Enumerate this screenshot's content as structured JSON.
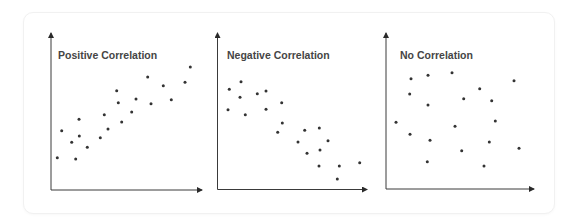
{
  "colors": {
    "axis": "#3a3a3a",
    "dot": "#333333",
    "title": "#454545",
    "card_border": "#f1f1f1"
  },
  "chart_data": [
    {
      "type": "scatter",
      "title": "Positive Correlation",
      "xlabel": "",
      "ylabel": "",
      "grid": false,
      "axes": {
        "origin": [
          51,
          190
        ],
        "x_end": 202,
        "y_top": 33
      },
      "points": [
        [
          57.3,
          157.7
        ],
        [
          61.7,
          130.7
        ],
        [
          71.7,
          142.3
        ],
        [
          75.7,
          159.0
        ],
        [
          79.0,
          119.3
        ],
        [
          79.3,
          136.0
        ],
        [
          87.3,
          147.3
        ],
        [
          100.3,
          137.7
        ],
        [
          104.3,
          114.7
        ],
        [
          108.0,
          129.0
        ],
        [
          116.7,
          90.7
        ],
        [
          118.3,
          102.7
        ],
        [
          121.7,
          122.0
        ],
        [
          131.7,
          112.0
        ],
        [
          136.0,
          99.0
        ],
        [
          147.7,
          77.0
        ],
        [
          151.0,
          103.7
        ],
        [
          163.3,
          85.7
        ],
        [
          171.3,
          99.7
        ],
        [
          185.0,
          82.3
        ],
        [
          190.3,
          67.0
        ]
      ]
    },
    {
      "type": "scatter",
      "title": "Negative Correlation",
      "xlabel": "",
      "ylabel": "",
      "grid": false,
      "axes": {
        "origin": [
          217.5,
          189.5
        ],
        "x_end": 367,
        "y_top": 33
      },
      "points": [
        [
          229.3,
          89.3
        ],
        [
          228.0,
          109.7
        ],
        [
          241.0,
          81.7
        ],
        [
          240.0,
          97.3
        ],
        [
          245.3,
          114.7
        ],
        [
          257.3,
          93.7
        ],
        [
          266.0,
          91.0
        ],
        [
          266.0,
          109.3
        ],
        [
          281.7,
          102.7
        ],
        [
          282.3,
          123.0
        ],
        [
          277.7,
          132.3
        ],
        [
          304.7,
          130.3
        ],
        [
          298.0,
          142.0
        ],
        [
          319.3,
          128.0
        ],
        [
          328.0,
          140.7
        ],
        [
          320.0,
          150.0
        ],
        [
          307.0,
          153.3
        ],
        [
          319.0,
          166.0
        ],
        [
          339.3,
          166.0
        ],
        [
          359.7,
          162.7
        ],
        [
          337.3,
          179.0
        ]
      ]
    },
    {
      "type": "scatter",
      "title": "No Correlation",
      "xlabel": "",
      "ylabel": "",
      "grid": false,
      "axes": {
        "origin": [
          386,
          189
        ],
        "x_end": 534,
        "y_top": 33
      },
      "points": [
        [
          411.0,
          78.7
        ],
        [
          428.0,
          75.3
        ],
        [
          452.0,
          72.7
        ],
        [
          514.0,
          80.7
        ],
        [
          409.7,
          94.0
        ],
        [
          479.7,
          88.7
        ],
        [
          463.7,
          98.7
        ],
        [
          491.7,
          100.7
        ],
        [
          428.0,
          105.0
        ],
        [
          396.0,
          122.3
        ],
        [
          495.3,
          121.0
        ],
        [
          455.0,
          126.3
        ],
        [
          410.0,
          134.3
        ],
        [
          430.0,
          140.3
        ],
        [
          489.3,
          142.0
        ],
        [
          519.0,
          148.3
        ],
        [
          461.7,
          150.7
        ],
        [
          427.3,
          161.7
        ],
        [
          484.0,
          166.0
        ]
      ]
    }
  ],
  "titles": {
    "positive": "Positive Correlation",
    "negative": "Negative Correlation",
    "none": "No Correlation"
  }
}
